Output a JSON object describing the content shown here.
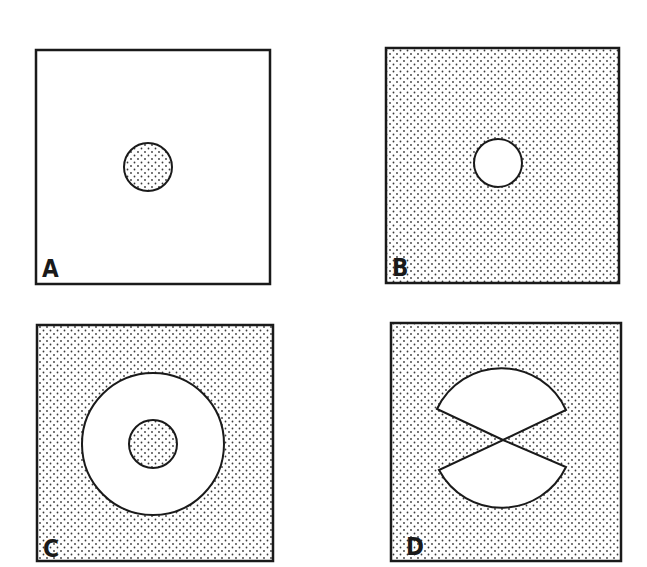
{
  "figure": {
    "colors": {
      "ink": "#1a1a1a",
      "background": "#ffffff",
      "stipple_dot": "#3a3a3a"
    },
    "panels": [
      {
        "label": "A",
        "background": "plain",
        "shapes": [
          {
            "type": "circle",
            "fill": "stippled",
            "relative_size": "small"
          }
        ]
      },
      {
        "label": "B",
        "background": "stippled",
        "shapes": [
          {
            "type": "circle",
            "fill": "plain",
            "relative_size": "small"
          }
        ]
      },
      {
        "label": "C",
        "background": "stippled",
        "shapes": [
          {
            "type": "annulus",
            "fill": "plain",
            "inner_fill": "stippled",
            "relative_size": "large"
          }
        ]
      },
      {
        "label": "D",
        "background": "stippled",
        "shapes": [
          {
            "type": "opposing-sectors",
            "fill": "plain",
            "count": 2,
            "orientation": "vertical"
          }
        ]
      }
    ]
  }
}
